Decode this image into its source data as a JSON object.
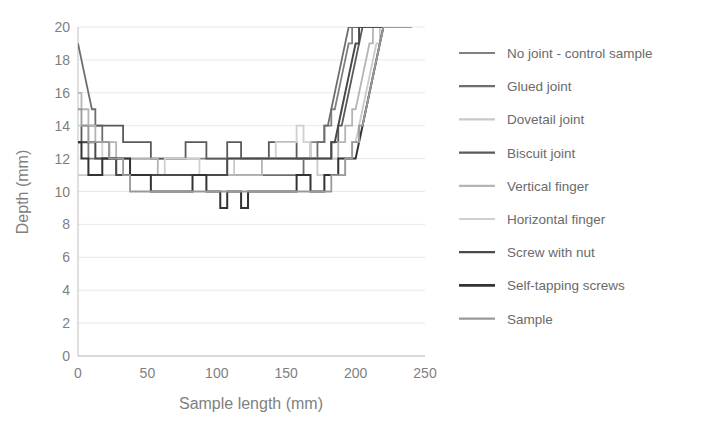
{
  "chart_data": {
    "type": "line",
    "title": "",
    "xlabel": "Sample length (mm)",
    "ylabel": "Depth (mm)",
    "xlim": [
      0,
      250
    ],
    "ylim": [
      0,
      20
    ],
    "xticks": [
      0,
      50,
      100,
      150,
      200,
      250
    ],
    "yticks": [
      0,
      2,
      4,
      6,
      8,
      10,
      12,
      14,
      16,
      18,
      20
    ],
    "grid": "horizontal",
    "legend_position": "right",
    "x": [
      0,
      5,
      10,
      15,
      20,
      25,
      30,
      35,
      40,
      45,
      50,
      55,
      60,
      65,
      70,
      75,
      80,
      85,
      90,
      95,
      100,
      105,
      110,
      115,
      120,
      125,
      130,
      135,
      140,
      145,
      150,
      155,
      160,
      165,
      170,
      175,
      180,
      185,
      190,
      195,
      200,
      205,
      210,
      215,
      220,
      225,
      230,
      235,
      240
    ],
    "series": [
      {
        "name": "No joint - control sample",
        "color": "#808080",
        "width": 1.8,
        "values": [
          13,
          13,
          12,
          12,
          12,
          12,
          12,
          12,
          12,
          12,
          12,
          12,
          12,
          12,
          12,
          12,
          12,
          12,
          12,
          12,
          12,
          12,
          12,
          12,
          12,
          12,
          12,
          12,
          12,
          12,
          12,
          12,
          12,
          12,
          13,
          13,
          14,
          15,
          17,
          19,
          20,
          20,
          20,
          20,
          20,
          20,
          20,
          20,
          20
        ]
      },
      {
        "name": "Glued joint",
        "color": "#6e6e6e",
        "width": 1.8,
        "values": [
          19,
          17,
          15,
          14,
          13,
          12,
          11,
          11,
          11,
          11,
          11,
          11,
          11,
          11,
          11,
          11,
          11,
          11,
          11,
          11,
          11,
          11,
          11,
          11,
          11,
          11,
          11,
          11,
          11,
          11,
          11,
          11,
          11,
          12,
          12,
          13,
          14,
          16,
          18,
          20,
          20,
          20,
          20,
          20,
          20,
          20,
          20,
          20,
          20
        ]
      },
      {
        "name": "Dovetail joint",
        "color": "#c9c9c9",
        "width": 1.8,
        "values": [
          11,
          11,
          11,
          11,
          11,
          11,
          11,
          11,
          11,
          11,
          11,
          11,
          11,
          11,
          11,
          11,
          11,
          11,
          11,
          11,
          11,
          11,
          11,
          12,
          12,
          12,
          12,
          12,
          12,
          12,
          12,
          12,
          12,
          12,
          12,
          11,
          11,
          11,
          11,
          12,
          13,
          15,
          17,
          19,
          20,
          20,
          20,
          20,
          20
        ]
      },
      {
        "name": "Biscuit joint",
        "color": "#5a5a5a",
        "width": 1.8,
        "values": [
          13,
          14,
          14,
          14,
          14,
          14,
          14,
          13,
          13,
          13,
          13,
          12,
          12,
          12,
          12,
          12,
          13,
          13,
          13,
          12,
          12,
          12,
          13,
          13,
          12,
          12,
          12,
          12,
          13,
          13,
          13,
          13,
          12,
          12,
          12,
          12,
          12,
          13,
          14,
          16,
          18,
          20,
          20,
          20,
          20,
          20,
          20,
          20,
          20
        ]
      },
      {
        "name": "Vertical finger",
        "color": "#b5b5b5",
        "width": 1.8,
        "values": [
          16,
          15,
          14,
          13,
          13,
          13,
          12,
          12,
          12,
          12,
          12,
          12,
          11,
          11,
          11,
          11,
          11,
          11,
          11,
          11,
          11,
          11,
          11,
          11,
          11,
          11,
          11,
          12,
          12,
          12,
          12,
          12,
          12,
          12,
          12,
          12,
          12,
          12,
          13,
          14,
          15,
          17,
          19,
          20,
          20,
          20,
          20,
          20,
          20
        ]
      },
      {
        "name": "Horizontal finger",
        "color": "#d0d0d0",
        "width": 1.8,
        "values": [
          14,
          14,
          13,
          13,
          12,
          12,
          11,
          11,
          11,
          11,
          11,
          11,
          11,
          12,
          12,
          12,
          12,
          12,
          11,
          11,
          11,
          11,
          12,
          12,
          12,
          12,
          12,
          12,
          12,
          13,
          13,
          13,
          14,
          13,
          12,
          12,
          12,
          12,
          12,
          12,
          13,
          14,
          16,
          18,
          20,
          20,
          20,
          20,
          20
        ]
      },
      {
        "name": "Screw with nut",
        "color": "#4a4a4a",
        "width": 2.0,
        "values": [
          13,
          13,
          13,
          12,
          12,
          12,
          11,
          11,
          11,
          11,
          11,
          11,
          11,
          11,
          11,
          11,
          11,
          11,
          11,
          11,
          11,
          11,
          12,
          12,
          12,
          12,
          12,
          12,
          12,
          12,
          12,
          12,
          12,
          12,
          12,
          12,
          12,
          13,
          15,
          17,
          19,
          20,
          20,
          20,
          20,
          20,
          20,
          20,
          20
        ]
      },
      {
        "name": "Self-tapping screws",
        "color": "#333333",
        "width": 2.0,
        "values": [
          13,
          12,
          11,
          11,
          12,
          12,
          12,
          12,
          11,
          11,
          11,
          10,
          10,
          10,
          10,
          10,
          10,
          11,
          11,
          10,
          10,
          9,
          10,
          10,
          9,
          10,
          10,
          10,
          10,
          10,
          10,
          10,
          11,
          11,
          10,
          10,
          11,
          11,
          12,
          12,
          12,
          14,
          16,
          18,
          20,
          20,
          20,
          20,
          20
        ]
      },
      {
        "name": "Sample",
        "color": "#9a9a9a",
        "width": 1.8,
        "values": [
          15,
          14,
          13,
          13,
          13,
          12,
          12,
          11,
          10,
          10,
          10,
          10,
          10,
          10,
          10,
          10,
          10,
          10,
          10,
          10,
          10,
          10,
          10,
          10,
          10,
          10,
          10,
          10,
          10,
          10,
          10,
          10,
          10,
          10,
          10,
          10,
          10,
          11,
          11,
          12,
          13,
          14,
          16,
          18,
          20,
          20,
          20,
          20,
          20
        ]
      }
    ]
  },
  "axes": {
    "x_title": "Sample length (mm)",
    "y_title": "Depth (mm)",
    "x_ticks": [
      "0",
      "50",
      "100",
      "150",
      "200",
      "250"
    ],
    "y_ticks": [
      "0",
      "2",
      "4",
      "6",
      "8",
      "10",
      "12",
      "14",
      "16",
      "18",
      "20"
    ]
  },
  "legend": {
    "items": [
      {
        "label": "No joint - control sample",
        "color": "#808080"
      },
      {
        "label": "Glued joint",
        "color": "#6e6e6e"
      },
      {
        "label": "Dovetail joint",
        "color": "#c9c9c9"
      },
      {
        "label": "Biscuit joint",
        "color": "#5a5a5a"
      },
      {
        "label": "Vertical finger",
        "color": "#b5b5b5"
      },
      {
        "label": "Horizontal finger",
        "color": "#d0d0d0"
      },
      {
        "label": "Screw with nut",
        "color": "#4a4a4a"
      },
      {
        "label": "Self-tapping screws",
        "color": "#333333"
      },
      {
        "label": "Sample",
        "color": "#9a9a9a"
      }
    ]
  },
  "style": {
    "background": "#ffffff",
    "grid_color": "#e8e8e8",
    "axis_color": "#bfbfbf",
    "text_color": "#7f7f7f"
  }
}
